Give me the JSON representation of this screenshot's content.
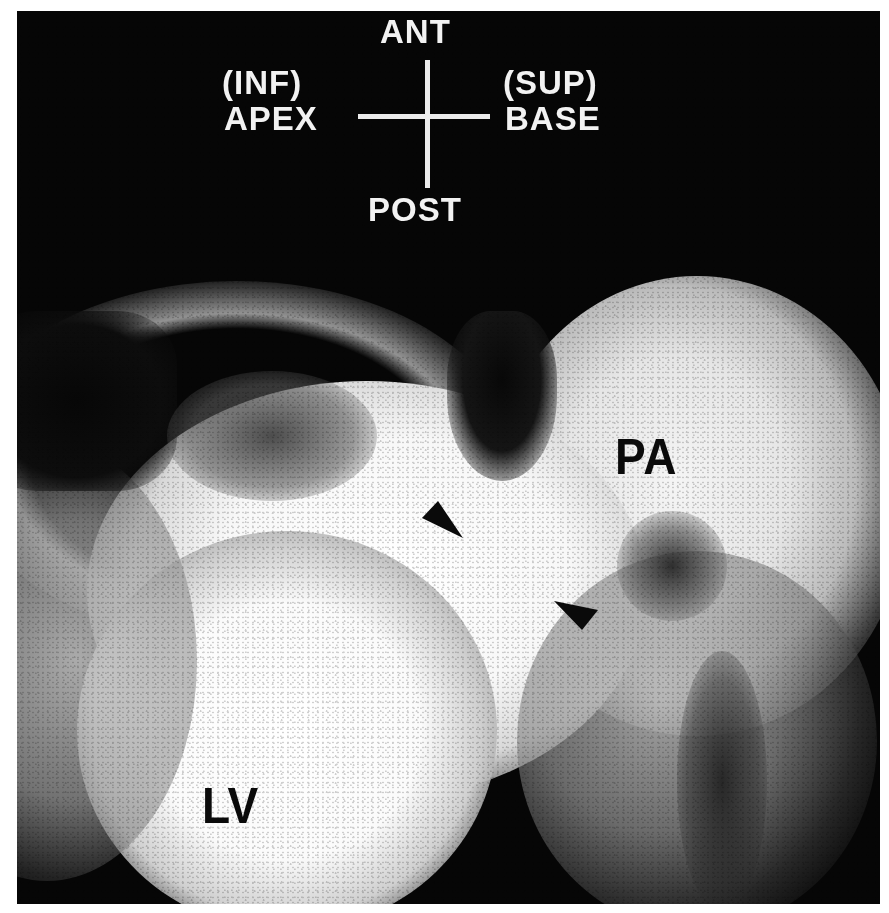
{
  "image": {
    "type": "grayscale medical scintigram (first-pass radionuclide angiogram)",
    "background_color": "#060606",
    "margin_color": "#ffffff"
  },
  "orientation_key": {
    "top": "ANT",
    "bottom": "POST",
    "left_line1": "(INF)",
    "left_line2": "APEX",
    "right_line1": "(SUP)",
    "right_line2": "BASE"
  },
  "structure_labels": {
    "pulmonary_artery": "PA",
    "left_ventricle": "LV"
  },
  "annotations": {
    "arrowheads": [
      {
        "description": "arrowhead pointing down-right, upper",
        "x": 445,
        "y": 520
      },
      {
        "description": "arrowhead pointing down-right, lower",
        "x": 578,
        "y": 612
      }
    ]
  }
}
